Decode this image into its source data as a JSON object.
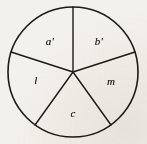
{
  "figure": {
    "kind": "pie-sector-diagram",
    "background_color": "#f3f1ec",
    "stroke_color": "#1c1a17",
    "circle": {
      "center_x": 73,
      "center_y": 72,
      "radius": 65,
      "outline_width": 1.6
    },
    "radii": [
      {
        "name": "radius-top",
        "angle_deg": 90,
        "end_x": 73,
        "end_y": 7
      },
      {
        "name": "radius-upper-left",
        "angle_deg": 162,
        "end_x": 11,
        "end_y": 52
      },
      {
        "name": "radius-lower-left",
        "angle_deg": 234,
        "end_x": 35,
        "end_y": 125
      },
      {
        "name": "radius-lower-right",
        "angle_deg": 306,
        "end_x": 111,
        "end_y": 125
      },
      {
        "name": "radius-upper-right",
        "angle_deg": 18,
        "end_x": 135,
        "end_y": 52
      }
    ],
    "sectors": [
      {
        "id": "a-prime",
        "label": "a'",
        "position": "top-left",
        "label_x": 50,
        "label_y": 41
      },
      {
        "id": "b-prime",
        "label": "b'",
        "position": "top-right",
        "label_x": 99,
        "label_y": 41
      },
      {
        "id": "l",
        "label": "l",
        "position": "left",
        "label_x": 36,
        "label_y": 80
      },
      {
        "id": "m",
        "label": "m",
        "position": "right",
        "label_x": 111,
        "label_y": 81
      },
      {
        "id": "c",
        "label": "c",
        "position": "bottom",
        "label_x": 73,
        "label_y": 113
      }
    ]
  },
  "chart_data": {
    "type": "pie",
    "title": "",
    "categories": [
      "a'",
      "b'",
      "m",
      "c",
      "l"
    ],
    "values": [
      72,
      72,
      72,
      72,
      72
    ],
    "units": "degrees",
    "legend": "none",
    "grid": false
  }
}
